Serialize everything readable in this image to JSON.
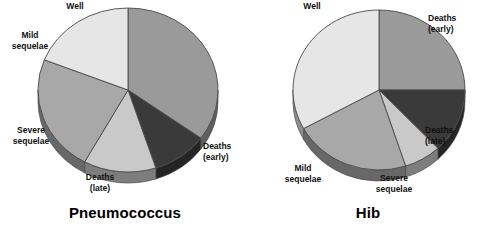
{
  "figure": {
    "background": "#ffffff",
    "width": 493,
    "height": 240
  },
  "palette": {
    "deaths_early": "#9a9a9a",
    "deaths_late": "#3a3a3a",
    "severe_sequelae": "#c9c9c9",
    "mild_sequelae": "#a8a8a8",
    "well": "#e6e6e6",
    "edge": "#4a4a4a",
    "depth_shadow": "#6e6e6e",
    "text": "#101010"
  },
  "chart_data": [
    {
      "type": "pie",
      "title": "Pneumococcus",
      "xlabel": "",
      "ylabel": "",
      "legend_position": "none",
      "grid": false,
      "start_angle_deg": 0,
      "direction": "clockwise",
      "three_d": true,
      "categories": [
        "Deaths (early)",
        "Deaths (late)",
        "Severe sequelae",
        "Mild sequelae",
        "Well"
      ],
      "values": [
        35,
        10,
        13,
        23,
        19
      ],
      "units": "percent",
      "slices": [
        {
          "label_line1": "Deaths",
          "label_line2": "(early)",
          "value": 35,
          "color": "#9a9a9a"
        },
        {
          "label_line1": "Deaths",
          "label_line2": "(late)",
          "value": 10,
          "color": "#3a3a3a"
        },
        {
          "label_line1": "Severe",
          "label_line2": "sequelae",
          "value": 13,
          "color": "#c9c9c9"
        },
        {
          "label_line1": "Mild",
          "label_line2": "sequelae",
          "value": 23,
          "color": "#a8a8a8"
        },
        {
          "label_line1": "Well",
          "label_line2": "",
          "value": 19,
          "color": "#e6e6e6"
        }
      ]
    },
    {
      "type": "pie",
      "title": "Hib",
      "xlabel": "",
      "ylabel": "",
      "legend_position": "none",
      "grid": false,
      "start_angle_deg": 0,
      "direction": "clockwise",
      "three_d": true,
      "categories": [
        "Deaths (early)",
        "Deaths (late)",
        "Severe sequelae",
        "Mild sequelae",
        "Well"
      ],
      "values": [
        25,
        13,
        7,
        22,
        33
      ],
      "units": "percent",
      "slices": [
        {
          "label_line1": "Deaths",
          "label_line2": "(early)",
          "value": 25,
          "color": "#9a9a9a"
        },
        {
          "label_line1": "Deaths",
          "label_line2": "(late)",
          "value": 13,
          "color": "#3a3a3a"
        },
        {
          "label_line1": "Severe",
          "label_line2": "sequelae",
          "value": 7,
          "color": "#c9c9c9"
        },
        {
          "label_line1": "Mild",
          "label_line2": "sequelae",
          "value": 22,
          "color": "#a8a8a8"
        },
        {
          "label_line1": "Well",
          "label_line2": "",
          "value": 33,
          "color": "#e6e6e6"
        }
      ]
    }
  ],
  "charts": {
    "pneumococcus": {
      "title": "Pneumococcus",
      "labels": {
        "well": "Well",
        "mild_1": "Mild",
        "mild_2": "sequelae",
        "severe_1": "Severe",
        "severe_2": "sequelae",
        "deaths_late_1": "Deaths",
        "deaths_late_2": "(late)",
        "deaths_early_1": "Deaths",
        "deaths_early_2": "(early)"
      }
    },
    "hib": {
      "title": "Hib",
      "labels": {
        "well": "Well",
        "mild_1": "Mild",
        "mild_2": "sequelae",
        "severe_1": "Severe",
        "severe_2": "sequelae",
        "deaths_late_1": "Deaths",
        "deaths_late_2": "(late)",
        "deaths_early_1": "Deaths",
        "deaths_early_2": "(early)"
      }
    }
  }
}
